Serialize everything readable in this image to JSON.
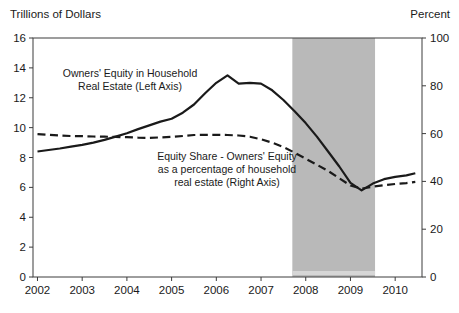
{
  "chart_data": {
    "type": "line",
    "title": "",
    "left_axis": {
      "title": "Trillions of Dollars",
      "min": 0,
      "max": 16,
      "ticks": [
        16,
        14,
        12,
        10,
        8,
        6,
        4,
        2,
        0
      ]
    },
    "right_axis": {
      "title": "Percent",
      "min": 0,
      "max": 100,
      "ticks": [
        100,
        80,
        60,
        40,
        20,
        0
      ]
    },
    "x_axis": {
      "min": 2001.9,
      "max": 2010.6,
      "ticks": [
        2002,
        2003,
        2004,
        2005,
        2006,
        2007,
        2008,
        2009,
        2010
      ]
    },
    "recession_band": {
      "start": 2007.7,
      "end": 2009.55,
      "color": "#b9b9b9",
      "bottom_strip_color": "#d6d6d6"
    },
    "line_color": "#1a1a1a",
    "series": [
      {
        "name": "Owners' Equity in Household Real Estate (Left Axis)",
        "axis": "left",
        "style": "solid",
        "x": [
          2002,
          2002.25,
          2002.5,
          2002.75,
          2003,
          2003.25,
          2003.5,
          2003.75,
          2004,
          2004.25,
          2004.5,
          2004.75,
          2005,
          2005.25,
          2005.5,
          2005.75,
          2006,
          2006.25,
          2006.5,
          2006.75,
          2007,
          2007.25,
          2007.5,
          2007.75,
          2008,
          2008.25,
          2008.5,
          2008.75,
          2009,
          2009.25,
          2009.5,
          2009.75,
          2010,
          2010.25,
          2010.45
        ],
        "values": [
          8.4,
          8.5,
          8.6,
          8.72,
          8.85,
          9.0,
          9.18,
          9.4,
          9.62,
          9.9,
          10.15,
          10.4,
          10.6,
          11.0,
          11.55,
          12.3,
          13.0,
          13.5,
          12.95,
          13.0,
          12.95,
          12.5,
          11.85,
          11.1,
          10.3,
          9.4,
          8.4,
          7.4,
          6.3,
          5.8,
          6.25,
          6.55,
          6.7,
          6.8,
          6.95
        ]
      },
      {
        "name": "Equity Share - Owners' Equity as a percentage of household real estate (Right Axis)",
        "axis": "right",
        "style": "dashed",
        "x": [
          2002,
          2002.25,
          2002.5,
          2002.75,
          2003,
          2003.25,
          2003.5,
          2003.75,
          2004,
          2004.25,
          2004.5,
          2004.75,
          2005,
          2005.25,
          2005.5,
          2005.75,
          2006,
          2006.25,
          2006.5,
          2006.75,
          2007,
          2007.25,
          2007.5,
          2007.75,
          2008,
          2008.25,
          2008.5,
          2008.75,
          2009,
          2009.25,
          2009.5,
          2009.75,
          2010,
          2010.25,
          2010.45
        ],
        "values": [
          59.8,
          59.5,
          59.2,
          59.0,
          58.9,
          58.8,
          58.7,
          58.6,
          58.5,
          58.3,
          58.2,
          58.4,
          58.6,
          59.0,
          59.4,
          59.5,
          59.5,
          59.4,
          59.2,
          58.7,
          57.6,
          56.2,
          54.4,
          52.0,
          49.5,
          47.0,
          44.4,
          41.3,
          38.3,
          37.0,
          37.8,
          38.4,
          38.9,
          39.3,
          39.8
        ]
      }
    ],
    "annotations": [
      {
        "lines": [
          "Owners' Equity in Household",
          "Real Estate (Left Axis)"
        ]
      },
      {
        "lines": [
          "Equity Share - Owners' Equity",
          "as a percentage of household",
          "real estate (Right Axis)"
        ]
      }
    ],
    "legend_position": "inline-annotations",
    "grid": false
  }
}
